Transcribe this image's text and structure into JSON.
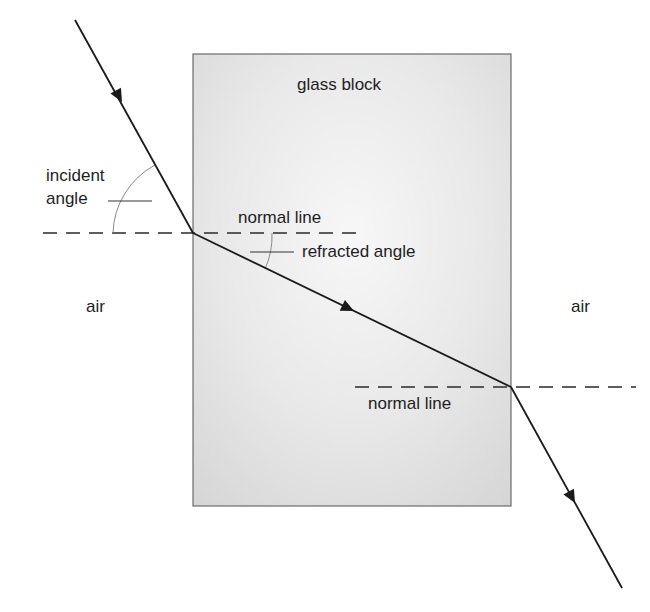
{
  "diagram": {
    "labels": {
      "glass_block": "glass block",
      "incident_angle_1": "incident",
      "incident_angle_2": "angle",
      "normal_line_top": "normal line",
      "refracted_angle": "refracted angle",
      "air_left": "air",
      "air_right": "air",
      "normal_line_bottom": "normal line"
    },
    "colors": {
      "ray": "#1a1a1a",
      "block_fill": "#e6e6e6",
      "block_border": "#6b6b6b",
      "normal": "#2a2a2a",
      "arc": "#8a8a8a"
    }
  }
}
